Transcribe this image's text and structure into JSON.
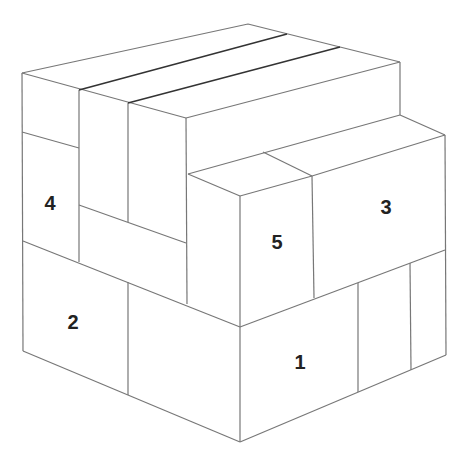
{
  "diagram": {
    "line_color": "#777777",
    "seam_color": "#333333",
    "labels": [
      {
        "text": "4",
        "x": 50,
        "y": 203
      },
      {
        "text": "3",
        "x": 386,
        "y": 207
      },
      {
        "text": "5",
        "x": 277,
        "y": 242
      },
      {
        "text": "2",
        "x": 73,
        "y": 322
      },
      {
        "text": "1",
        "x": 300,
        "y": 362
      }
    ]
  }
}
